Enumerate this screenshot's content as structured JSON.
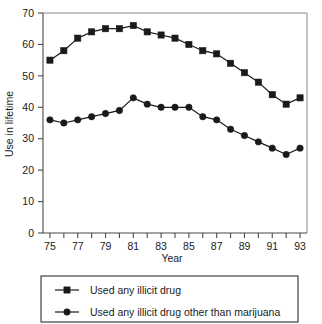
{
  "chart_data": {
    "type": "line",
    "title": "",
    "xlabel": "Year",
    "ylabel": "Use in lifetime",
    "xlim": [
      74.5,
      93.5
    ],
    "ylim": [
      0,
      70
    ],
    "yticks": [
      0,
      10,
      20,
      30,
      40,
      50,
      60,
      70
    ],
    "ytick_labels": [
      "0",
      "10",
      "20",
      "30",
      "40",
      "50",
      "60",
      "70"
    ],
    "xticks": [
      75,
      76,
      77,
      78,
      79,
      80,
      81,
      82,
      83,
      84,
      85,
      86,
      87,
      88,
      89,
      90,
      91,
      92,
      93
    ],
    "xtick_labels_shown": [
      "75",
      "77",
      "79",
      "81",
      "83",
      "85",
      "87",
      "89",
      "91",
      "93"
    ],
    "x": [
      75,
      76,
      77,
      78,
      79,
      80,
      81,
      82,
      83,
      84,
      85,
      86,
      87,
      88,
      89,
      90,
      91,
      92,
      93
    ],
    "grid": false,
    "legend_position": "below-plot",
    "series": [
      {
        "name": "Used any illicit drug",
        "marker": "square",
        "color": "#1a1a1a",
        "values": [
          55,
          58,
          62,
          64,
          65,
          65,
          66,
          64,
          63,
          62,
          60,
          58,
          57,
          54,
          51,
          48,
          44,
          41,
          43
        ]
      },
      {
        "name": "Used any illicit drug other than marijuana",
        "marker": "circle",
        "color": "#1a1a1a",
        "values": [
          36,
          35,
          36,
          37,
          38,
          39,
          43,
          41,
          40,
          40,
          40,
          37,
          36,
          33,
          31,
          29,
          27,
          25,
          27
        ]
      }
    ]
  },
  "legend": {
    "entries": [
      {
        "label": "Used any illicit drug",
        "marker": "square"
      },
      {
        "label": "Used any illicit drug other than marijuana",
        "marker": "circle"
      }
    ]
  },
  "colors": {
    "ink": "#1a1a1a",
    "axis": "#4a4a4a",
    "frame": "#8a8a8a",
    "background": "#ffffff"
  }
}
